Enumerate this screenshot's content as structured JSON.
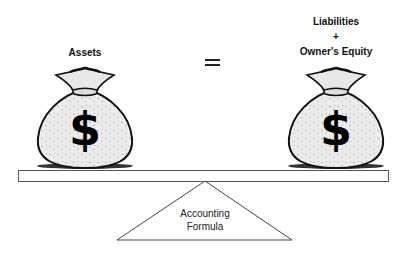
{
  "diagram": {
    "left_label": "Assets",
    "operator": "=",
    "right_label_line1": "Liabilities",
    "right_label_line2": "+",
    "right_label_line3": "Owner's Equity",
    "fulcrum_line1": "Accounting",
    "fulcrum_line2": "Formula",
    "left_bag_symbol": "$",
    "right_bag_symbol": "$"
  }
}
